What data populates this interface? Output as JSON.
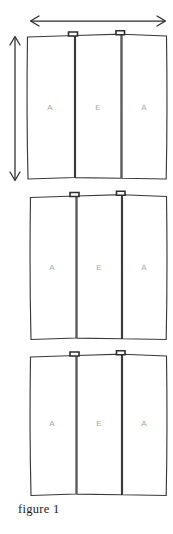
{
  "figure": {
    "caption": "figure 1",
    "background_color": "#ffffff",
    "outline_color": "#3a3a3a",
    "label_color": "#a8a8a8",
    "dimension_color": "#2b2b2b"
  },
  "dimensions": {
    "width_arrow": {
      "name": "horizontal-double-arrow",
      "orientation": "horizontal",
      "double_headed": true,
      "label": ""
    },
    "height_arrow": {
      "name": "vertical-double-arrow",
      "orientation": "vertical",
      "double_headed": true,
      "label": ""
    }
  },
  "groups": [
    {
      "id": "group-1",
      "panels": [
        {
          "id": "panel-1-1",
          "label": "A",
          "has_tab": false
        },
        {
          "id": "panel-1-2",
          "label": "E",
          "has_tab": true
        },
        {
          "id": "panel-1-3",
          "label": "A",
          "has_tab": true
        }
      ]
    },
    {
      "id": "group-2",
      "panels": [
        {
          "id": "panel-2-1",
          "label": "A",
          "has_tab": false
        },
        {
          "id": "panel-2-2",
          "label": "E",
          "has_tab": true
        },
        {
          "id": "panel-2-3",
          "label": "A",
          "has_tab": true
        }
      ]
    },
    {
      "id": "group-3",
      "panels": [
        {
          "id": "panel-3-1",
          "label": "A",
          "has_tab": false
        },
        {
          "id": "panel-3-2",
          "label": "E",
          "has_tab": true
        },
        {
          "id": "panel-3-3",
          "label": "A",
          "has_tab": true
        }
      ]
    }
  ]
}
